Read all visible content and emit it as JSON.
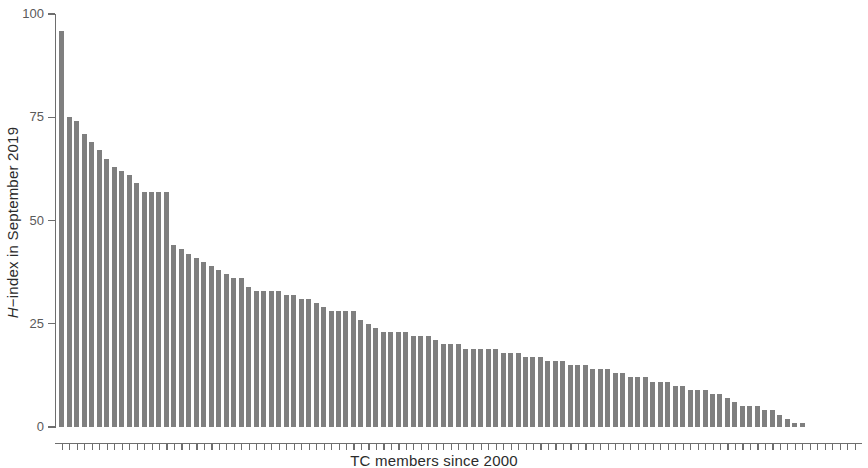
{
  "chart_data": {
    "type": "bar",
    "title": "",
    "subtitle": "",
    "xlabel": "TC members since 2000",
    "ylabel": "H-index in September 2019",
    "ylabel_italic_prefix": "H",
    "ylabel_rest": "−index in September 2019",
    "ylim": [
      0,
      100
    ],
    "xlim": [
      0,
      107
    ],
    "ytick_labels": [
      "0",
      "25",
      "50",
      "75",
      "100"
    ],
    "ytick_values": [
      0,
      25,
      50,
      75,
      100
    ],
    "grid": false,
    "legend": null,
    "bar_color": "#7f7f7f",
    "axis_color": "#6e6e6e",
    "tick_label_color": "#5a5a5a",
    "label_color": "#2b2b2b",
    "n_bars": 100,
    "categories": [
      "1",
      "2",
      "3",
      "4",
      "5",
      "6",
      "7",
      "8",
      "9",
      "10",
      "11",
      "12",
      "13",
      "14",
      "15",
      "16",
      "17",
      "18",
      "19",
      "20",
      "21",
      "22",
      "23",
      "24",
      "25",
      "26",
      "27",
      "28",
      "29",
      "30",
      "31",
      "32",
      "33",
      "34",
      "35",
      "36",
      "37",
      "38",
      "39",
      "40",
      "41",
      "42",
      "43",
      "44",
      "45",
      "46",
      "47",
      "48",
      "49",
      "50",
      "51",
      "52",
      "53",
      "54",
      "55",
      "56",
      "57",
      "58",
      "59",
      "60",
      "61",
      "62",
      "63",
      "64",
      "65",
      "66",
      "67",
      "68",
      "69",
      "70",
      "71",
      "72",
      "73",
      "74",
      "75",
      "76",
      "77",
      "78",
      "79",
      "80",
      "81",
      "82",
      "83",
      "84",
      "85",
      "86",
      "87",
      "88",
      "89",
      "90",
      "91",
      "92",
      "93",
      "94",
      "95",
      "96",
      "97",
      "98",
      "99",
      "100"
    ],
    "values": [
      96,
      75,
      74,
      71,
      69,
      67,
      65,
      63,
      62,
      61,
      59,
      57,
      57,
      57,
      57,
      44,
      43,
      42,
      41,
      40,
      39,
      38,
      37,
      36,
      36,
      34,
      33,
      33,
      33,
      33,
      32,
      32,
      31,
      31,
      30,
      29,
      28,
      28,
      28,
      28,
      26,
      25,
      24,
      23,
      23,
      23,
      23,
      22,
      22,
      22,
      21,
      20,
      20,
      20,
      19,
      19,
      19,
      19,
      19,
      18,
      18,
      18,
      17,
      17,
      17,
      16,
      16,
      16,
      15,
      15,
      15,
      14,
      14,
      14,
      13,
      13,
      12,
      12,
      12,
      11,
      11,
      11,
      10,
      10,
      9,
      9,
      9,
      8,
      8,
      7,
      6,
      5,
      5,
      5,
      4,
      4,
      3,
      2,
      1,
      1
    ]
  }
}
